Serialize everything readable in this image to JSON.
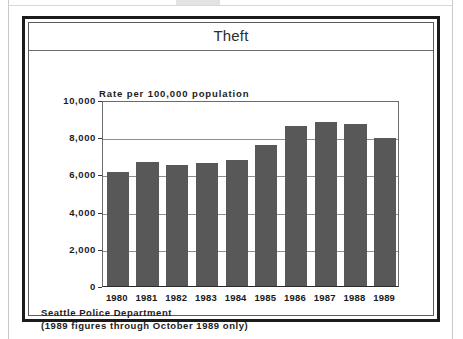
{
  "figure": {
    "title": "Theft",
    "footnote_line1": "Seattle Police Department",
    "footnote_line2": "(1989 figures through October 1989 only)"
  },
  "colors": {
    "bar_fill": "#585859",
    "frame": "#1b1b1b",
    "gridline": "#8e8e8e",
    "text": "#1c1c1c"
  },
  "chart_data": {
    "type": "bar",
    "title": "Theft",
    "subtitle": "Rate per 100,000 population",
    "xlabel": "",
    "ylabel": "Rate per 100,000 population",
    "categories": [
      "1980",
      "1981",
      "1982",
      "1983",
      "1984",
      "1985",
      "1986",
      "1987",
      "1988",
      "1989"
    ],
    "values": [
      6150,
      6650,
      6500,
      6600,
      6800,
      7600,
      8600,
      8800,
      8700,
      7950
    ],
    "ylim": [
      0,
      10000
    ],
    "ytick_labels": [
      "10,000",
      "8,000",
      "6,000",
      "4,000",
      "2,000",
      "0"
    ],
    "ytick_values": [
      10000,
      8000,
      6000,
      4000,
      2000,
      0
    ],
    "grid": true,
    "legend": false,
    "annotations": [
      "Seattle Police Department",
      "(1989 figures through October 1989 only)"
    ]
  }
}
